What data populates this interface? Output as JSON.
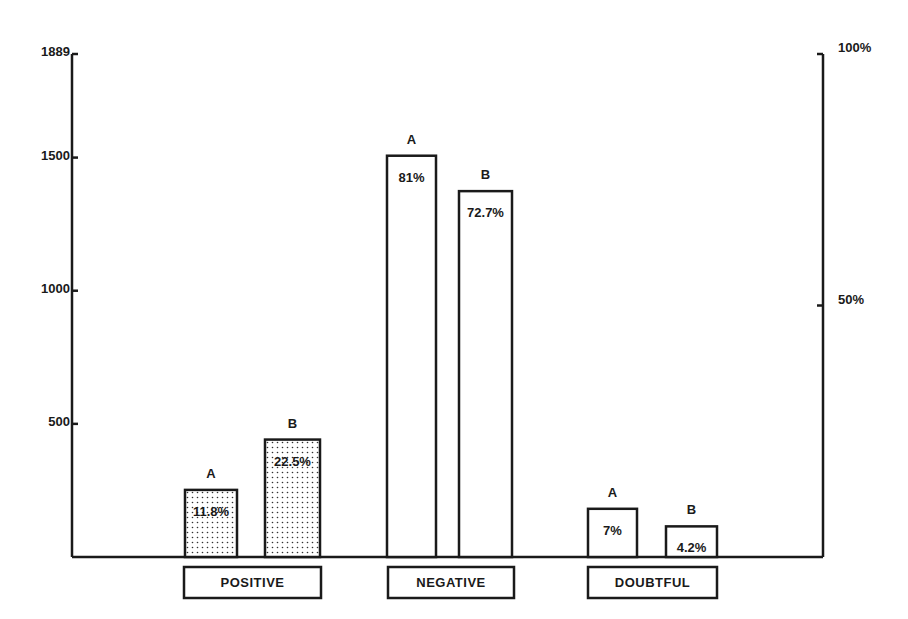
{
  "chart_data": {
    "type": "bar",
    "title": "",
    "xlabel": "",
    "ylabel": "",
    "categories": [
      "POSITIVE",
      "NEGATIVE",
      "DOUBTFUL"
    ],
    "series": [
      {
        "name": "A",
        "values": [
          252,
          1507,
          181
        ],
        "percent_labels": [
          "11.8%",
          "81%",
          "7%"
        ]
      },
      {
        "name": "B",
        "values": [
          441,
          1374,
          115
        ],
        "percent_labels": [
          "22.5%",
          "72.7%",
          "4.2%"
        ]
      }
    ],
    "left_axis": {
      "ticks": [
        500,
        1000,
        1500,
        1889
      ],
      "tick_labels": [
        "500",
        "1000",
        "1500",
        "1889"
      ],
      "ylim": [
        0,
        1889
      ]
    },
    "right_axis": {
      "ticks": [
        50,
        100
      ],
      "tick_labels": [
        "50%",
        "100%"
      ],
      "ylim": [
        0,
        100
      ]
    },
    "fill": {
      "POSITIVE": "dotted",
      "NEGATIVE": "none",
      "DOUBTFUL": "none"
    },
    "grid": false,
    "legend": "none (bars labeled A / B above each bar)"
  }
}
